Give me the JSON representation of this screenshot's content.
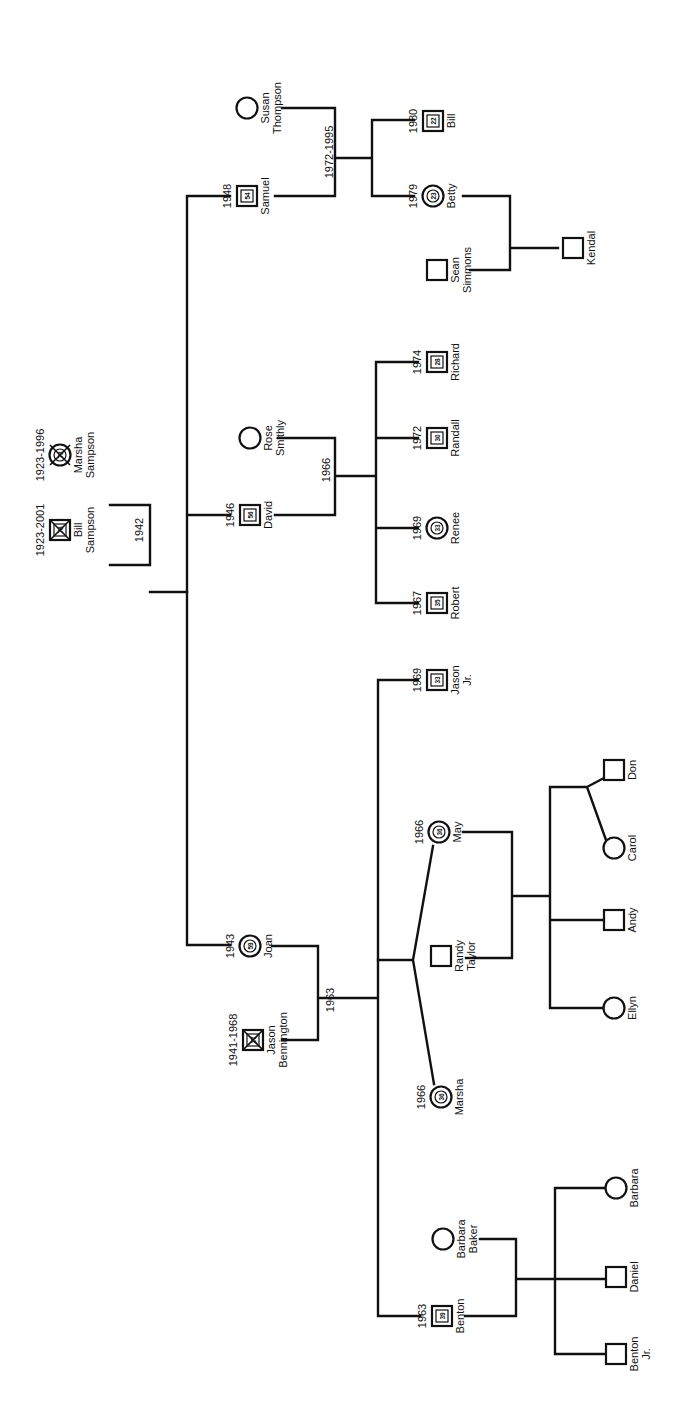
{
  "orientation": "rotated-90-cw",
  "people": [
    {
      "id": "bill_sr",
      "name": [
        "Bill",
        "Sampson"
      ],
      "sex": "M",
      "age": "78",
      "deceased": true,
      "date": "1923-2001",
      "x": 60,
      "y": 530
    },
    {
      "id": "marsha_sr",
      "name": [
        "Marsha",
        "Sampson"
      ],
      "sex": "F",
      "age": "73",
      "deceased": true,
      "date": "1923-1996",
      "x": 60,
      "y": 455
    },
    {
      "id": "samuel",
      "name": [
        "Samuel"
      ],
      "sex": "M",
      "age": "54",
      "deceased": false,
      "date": "1948",
      "x": 247,
      "y": 196
    },
    {
      "id": "susan",
      "name": [
        "Susan",
        "Thompson"
      ],
      "sex": "F",
      "age": "",
      "deceased": false,
      "date": "",
      "x": 247,
      "y": 108
    },
    {
      "id": "bill_jr",
      "name": [
        "Bill"
      ],
      "sex": "M",
      "age": "22",
      "deceased": false,
      "date": "1980",
      "x": 433,
      "y": 121
    },
    {
      "id": "betty",
      "name": [
        "Betty"
      ],
      "sex": "F",
      "age": "23",
      "deceased": false,
      "date": "1979",
      "x": 433,
      "y": 196
    },
    {
      "id": "sean",
      "name": [
        "Sean",
        "Simmons"
      ],
      "sex": "M",
      "age": "",
      "deceased": false,
      "date": "",
      "x": 437,
      "y": 270
    },
    {
      "id": "kendal",
      "name": [
        "Kendal"
      ],
      "sex": "M",
      "age": "",
      "deceased": false,
      "date": "",
      "x": 573,
      "y": 248
    },
    {
      "id": "david",
      "name": [
        "David"
      ],
      "sex": "M",
      "age": "56",
      "deceased": false,
      "date": "1946",
      "x": 250,
      "y": 515
    },
    {
      "id": "rose",
      "name": [
        "Rose",
        "Smithly"
      ],
      "sex": "F",
      "age": "",
      "deceased": false,
      "date": "",
      "x": 250,
      "y": 438
    },
    {
      "id": "richard",
      "name": [
        "Richard"
      ],
      "sex": "M",
      "age": "28",
      "deceased": false,
      "date": "1974",
      "x": 437,
      "y": 362
    },
    {
      "id": "randall",
      "name": [
        "Randall"
      ],
      "sex": "M",
      "age": "30",
      "deceased": false,
      "date": "1972",
      "x": 437,
      "y": 438
    },
    {
      "id": "renee",
      "name": [
        "Renee"
      ],
      "sex": "F",
      "age": "33",
      "deceased": false,
      "date": "1969",
      "x": 437,
      "y": 528
    },
    {
      "id": "robert",
      "name": [
        "Robert"
      ],
      "sex": "M",
      "age": "35",
      "deceased": false,
      "date": "1967",
      "x": 437,
      "y": 603
    },
    {
      "id": "joan",
      "name": [
        "Joan"
      ],
      "sex": "F",
      "age": "59",
      "deceased": false,
      "date": "1943",
      "x": 250,
      "y": 946
    },
    {
      "id": "jason_sr",
      "name": [
        "Jason",
        "Bennington"
      ],
      "sex": "M",
      "age": "27",
      "deceased": true,
      "date": "1941-1968",
      "x": 253,
      "y": 1040
    },
    {
      "id": "jason_jr",
      "name": [
        "Jason",
        "Jr."
      ],
      "sex": "M",
      "age": "33",
      "deceased": false,
      "date": "1969",
      "x": 437,
      "y": 680
    },
    {
      "id": "may",
      "name": [
        "May"
      ],
      "sex": "F",
      "age": "36",
      "deceased": false,
      "date": "1966",
      "x": 439,
      "y": 832
    },
    {
      "id": "marsha_t",
      "name": [
        "Marsha"
      ],
      "sex": "F",
      "age": "36",
      "deceased": false,
      "date": "1966",
      "x": 441,
      "y": 1097
    },
    {
      "id": "randy",
      "name": [
        "Randy",
        "Taylor"
      ],
      "sex": "M",
      "age": "",
      "deceased": false,
      "date": "",
      "x": 441,
      "y": 956
    },
    {
      "id": "don",
      "name": [
        "Don"
      ],
      "sex": "M",
      "age": "",
      "deceased": false,
      "date": "",
      "x": 614,
      "y": 770
    },
    {
      "id": "carol",
      "name": [
        "Carol"
      ],
      "sex": "F",
      "age": "",
      "deceased": false,
      "date": "",
      "x": 614,
      "y": 848
    },
    {
      "id": "andy",
      "name": [
        "Andy"
      ],
      "sex": "M",
      "age": "",
      "deceased": false,
      "date": "",
      "x": 614,
      "y": 920
    },
    {
      "id": "ellyn",
      "name": [
        "Ellyn"
      ],
      "sex": "F",
      "age": "",
      "deceased": false,
      "date": "",
      "x": 614,
      "y": 1008
    },
    {
      "id": "barbara_b",
      "name": [
        "Barbara",
        "Baker"
      ],
      "sex": "F",
      "age": "",
      "deceased": false,
      "date": "",
      "x": 443,
      "y": 1239
    },
    {
      "id": "barbara",
      "name": [
        "Barbara"
      ],
      "sex": "F",
      "age": "",
      "deceased": false,
      "date": "",
      "x": 616,
      "y": 1188
    },
    {
      "id": "daniel",
      "name": [
        "Daniel"
      ],
      "sex": "M",
      "age": "",
      "deceased": false,
      "date": "",
      "x": 616,
      "y": 1277
    },
    {
      "id": "benton_jr",
      "name": [
        "Benton",
        "Jr."
      ],
      "sex": "M",
      "age": "",
      "deceased": false,
      "date": "",
      "x": 616,
      "y": 1354
    },
    {
      "id": "benton",
      "name": [
        "Benton"
      ],
      "sex": "M",
      "age": "39",
      "deceased": false,
      "date": "1963",
      "x": 442,
      "y": 1316
    }
  ],
  "marriage_labels": [
    {
      "text": "1942",
      "x": 143,
      "y": 530
    },
    {
      "text": "1972-1995",
      "x": 333,
      "y": 152
    },
    {
      "text": "1966",
      "x": 330,
      "y": 470
    },
    {
      "text": "1963",
      "x": 334,
      "y": 1000
    }
  ],
  "lines": [
    "M150,505 L150,565 M110,505 L150,505 M110,565 L150,565 M150,592 L187,592",
    "M187,196 L187,945 M187,196 L230,196 M187,515 L230,515 M187,945 L230,945",
    "M275,196 L335,196 L335,108 L282,108 M335,158 L372,158 M372,120 L372,196 M372,120 L414,120 M372,196 L414,196",
    "M463,196 L510,196 L510,270 L470,270 M510,248 L558,248",
    "M275,515 L335,515 L335,438 L278,438 M335,476 L376,476 M376,362 L376,603 M376,362 L418,362 M376,438 L418,438 M376,528 L418,528 M376,603 L418,603",
    "M272,946 L318,946 L318,1040 L282,1040 M318,998 L378,998 M378,680 L378,1316 M378,680 L418,680 M378,1316 L420,1316",
    "M378,960 L413,960 M413,960 L433,846 M413,960 L434,1084",
    "M463,832 L512,832 L512,958 L466,958 M512,896 L550,896 M550,787 L550,1008 M550,787 L587,787 M587,787 L604,778 M587,787 L606,840 M550,920 L602,920 M550,1008 L602,1008",
    "M465,1316 L516,1316 L516,1239 L480,1239 M516,1279 L555,1279 M555,1188 L555,1354 M555,1188 L604,1188 M555,1279 L604,1279 M555,1354 L604,1354"
  ]
}
